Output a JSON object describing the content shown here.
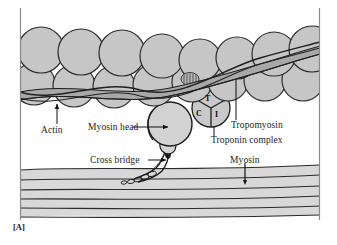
{
  "figure": {
    "panel_letter": "[A]",
    "border_color": "#8a8a8a",
    "background": "#ffffff"
  },
  "labels": {
    "actin": "Actin",
    "myosin_head": "Myosin head",
    "tropomyosin": "Tropomyosin",
    "troponin_complex": "Troponin complex",
    "cross_bridge": "Cross bridge",
    "myosin": "Myosin"
  },
  "troponin_sectors": {
    "t": "T",
    "c": "C",
    "i": "I"
  },
  "colors": {
    "actin_sphere_fill": "#c6c6c6",
    "actin_sphere_stroke": "#2b2b2b",
    "tropomyosin_fill": "#a8a8a8",
    "tropomyosin_stroke": "#1f1f1f",
    "myosin_head_fill": "#d2d2d2",
    "myosin_head_stroke": "#1a1a1a",
    "myosin_filament_fill": "#d8d8d8",
    "myosin_filament_stroke": "#2b2b2b",
    "troponin_fill": "#c9c9c9",
    "troponin_stroke": "#1f1f1f",
    "leader_line": "#111111",
    "text": "#1a1a1a"
  },
  "structures": {
    "actin_spheres_top_row": 11,
    "actin_spheres_bottom_row": 10,
    "myosin_filament_lines": 6,
    "tropomyosin_strands": 2
  }
}
